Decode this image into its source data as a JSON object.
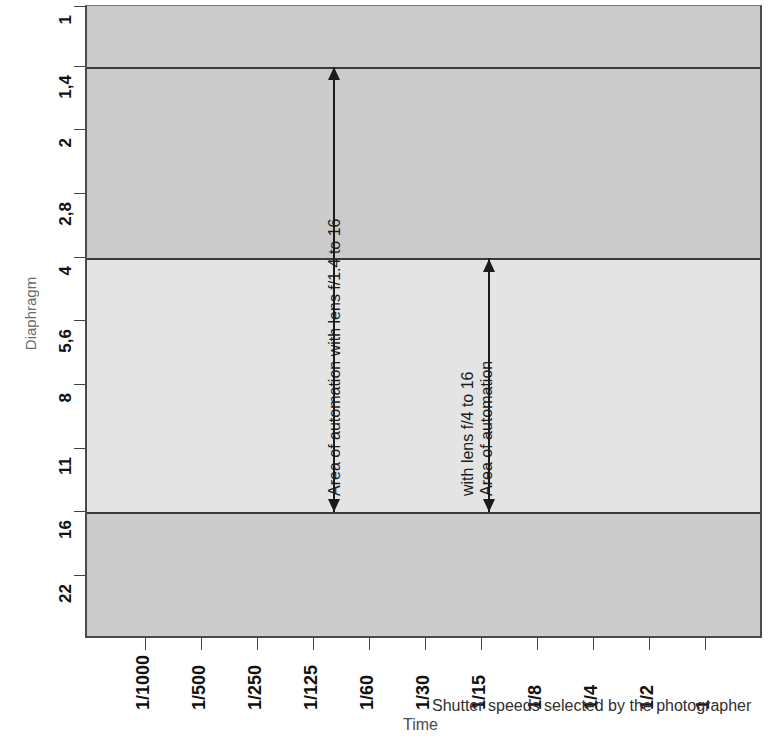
{
  "chart_data": {
    "type": "area",
    "title": "",
    "xlabel": "Time",
    "xlabel_secondary": "Shutter speeds selected by the photographer",
    "ylabel": "Diaphragm",
    "x_tick_labels": [
      "1/1000",
      "1/500",
      "1/250",
      "1/125",
      "1/60",
      "1/30",
      "1/15",
      "1/8",
      "1/4",
      "1/2",
      "1"
    ],
    "y_tick_labels": [
      "1",
      "1,4",
      "2",
      "2,8",
      "4",
      "5,6",
      "8",
      "11",
      "16",
      "22"
    ],
    "grid": false,
    "legend": "none",
    "bands": [
      {
        "name": "upper-dark-band",
        "from": "1",
        "to": "4",
        "color": "#cbcbcb"
      },
      {
        "name": "middle-light-band",
        "from": "4",
        "to": "16",
        "color": "#e4e4e4"
      },
      {
        "name": "lower-dark-band",
        "from": "16",
        "to": "bottom",
        "color": "#cbcbcb"
      }
    ],
    "boundary_lines": [
      "1,4",
      "4",
      "16"
    ],
    "annotations": [
      {
        "name": "automation-range-f1.4",
        "text": "Area of automation with lens f/1.4 to 16",
        "from_aperture": "1,4",
        "to_aperture": "16",
        "at_shutter_speed": "1/125"
      },
      {
        "name": "automation-range-f4",
        "line1": "Area of automation",
        "line2": "with lens f/4 to 16",
        "from_aperture": "4",
        "to_aperture": "16",
        "at_shutter_speed": "between 1/30 and 1/15"
      }
    ]
  },
  "axes": {
    "y_title": "Diaphragm",
    "x_title_time": "Time",
    "x_title_main": "Shutter speeds selected by the photographer",
    "y_ticks": [
      {
        "label": "1",
        "y": 6
      },
      {
        "label": "1,4",
        "y": 66
      },
      {
        "label": "2",
        "y": 129
      },
      {
        "label": "2,8",
        "y": 193
      },
      {
        "label": "4",
        "y": 257
      },
      {
        "label": "5,6",
        "y": 320
      },
      {
        "label": "8",
        "y": 384
      },
      {
        "label": "11",
        "y": 448
      },
      {
        "label": "16",
        "y": 511
      },
      {
        "label": "22",
        "y": 575
      }
    ],
    "x_ticks": [
      {
        "label": "1/1000",
        "x": 145
      },
      {
        "label": "1/500",
        "x": 201
      },
      {
        "label": "1/250",
        "x": 257
      },
      {
        "label": "1/125",
        "x": 313
      },
      {
        "label": "1/60",
        "x": 369
      },
      {
        "label": "1/30",
        "x": 425
      },
      {
        "label": "1/15",
        "x": 481
      },
      {
        "label": "1/8",
        "x": 537
      },
      {
        "label": "1/4",
        "x": 593
      },
      {
        "label": "1/2",
        "x": 649
      },
      {
        "label": "1",
        "x": 705
      }
    ]
  },
  "annotations": {
    "first": "Area of automation with lens f/1.4 to 16",
    "second_line1": "Area of automation",
    "second_line2": "with lens f/4 to 16"
  },
  "colors": {
    "band_dark": "#cbcbcb",
    "band_light": "#e4e4e4",
    "line": "#3a3a3a",
    "text": "#111111",
    "muted_text": "#6a6a6a"
  }
}
